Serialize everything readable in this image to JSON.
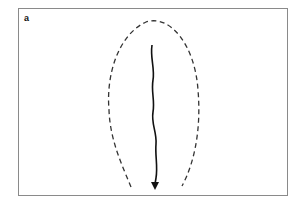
{
  "figure": {
    "panel_label": "a",
    "elements": [
      {
        "type": "dashed-outline",
        "description": "elongated U-shaped dashed boundary, open at bottom"
      },
      {
        "type": "wavy-arrow",
        "description": "solid wavy line descending with arrowhead at bottom"
      }
    ],
    "colors": {
      "frame": "#8a8a8a",
      "dashed_outline": "#333333",
      "arrow": "#111111",
      "background": "#ffffff"
    }
  }
}
